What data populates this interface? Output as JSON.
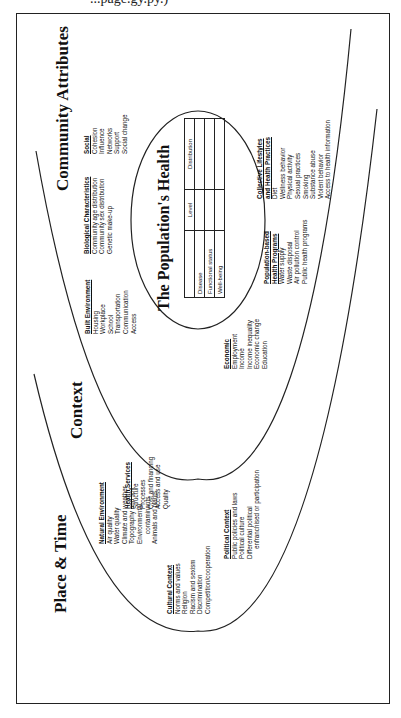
{
  "header_fragment": "...page.gy.py.)",
  "titles": {
    "place_time": "Place & Time",
    "context": "Context",
    "community": "Community Attributes",
    "population_health": "The Population's Health"
  },
  "blocks": {
    "natural_environment": {
      "heading": "Natural Environment",
      "items": [
        "Air quality",
        "Water quality",
        "Climate and weather",
        "Topography and soil",
        "Environmental",
        "contaminants",
        "Animals and plants"
      ]
    },
    "cultural_context": {
      "heading": "Cultural Context",
      "items": [
        "Norms and values",
        "Religion",
        "Racism and sexism",
        "Discrimination",
        "Competition/cooperation"
      ]
    },
    "political_context": {
      "heading": "Political Context",
      "items": [
        "Public policies and laws",
        "Political culture",
        "Differential political",
        "enfranchised or participation"
      ]
    },
    "health_services": {
      "heading": "Health Services",
      "items": [
        "Structure",
        "Processes",
        "Cost and financing",
        "Access and use",
        "Quality"
      ]
    },
    "economic": {
      "heading": "Economic",
      "items": [
        "Employment",
        "Income",
        "Income inequality",
        "Economic change",
        "Education"
      ]
    },
    "built_environment": {
      "heading": "Built Environment",
      "items": [
        "Housing",
        "Workplace",
        "School",
        "Transportation",
        "Communication",
        "Access"
      ]
    },
    "biological": {
      "heading": "Biological Characteristics",
      "items": [
        "Community age distribution",
        "Community sex distribution",
        "Genetic make-up"
      ]
    },
    "social": {
      "heading": "Social",
      "items": [
        "Cohesion",
        "Influence",
        "Networks",
        "Support",
        "Social change"
      ]
    },
    "population_programs": {
      "heading1": "Population-based",
      "heading2": "Health Programs",
      "items": [
        "Water supply",
        "Waste disposal",
        "Air pollution control",
        "Public health programs"
      ]
    },
    "collective_lifestyles": {
      "heading1": "Collective Lifestyles",
      "heading2": "and Health Practices",
      "items": [
        "Diet",
        "Wellness behavior",
        "Physical activity",
        "Sexual practices",
        "Smoking",
        "Substance abuse",
        "Violent behavior",
        "Access to health information"
      ]
    }
  },
  "health_table": {
    "columns": [
      "",
      "Level",
      "Distribution"
    ],
    "rows": [
      "Disease",
      "Functional status",
      "Well-being"
    ]
  }
}
